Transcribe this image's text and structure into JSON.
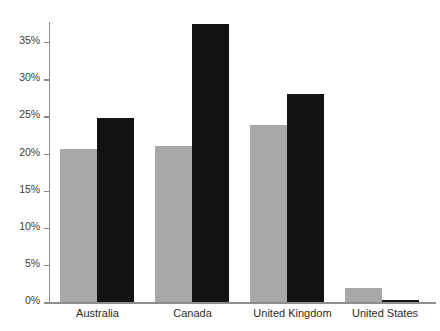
{
  "chart_data": {
    "type": "bar",
    "title": "",
    "subtitle": "",
    "xlabel": "",
    "ylabel": "",
    "categories": [
      "Australia",
      "Canada",
      "United Kingdom",
      "United States"
    ],
    "series": [
      {
        "name": "series-1",
        "color": "#a8a8a8",
        "values": [
          20.6,
          21.0,
          23.8,
          1.9
        ]
      },
      {
        "name": "series-2",
        "color": "#121212",
        "values": [
          24.8,
          37.5,
          28.0,
          0.3
        ]
      }
    ],
    "ylim": [
      0,
      37.5
    ],
    "y_ticks": [
      0,
      5,
      10,
      15,
      20,
      25,
      30,
      35
    ],
    "y_tick_labels": [
      "0%",
      "5%",
      "10%",
      "15%",
      "20%",
      "25%",
      "30%",
      "35%"
    ],
    "grid": false,
    "legend": "none",
    "axis_color": "#8e8e8e",
    "tick_label_color": "#3d3d3d",
    "category_label_color": "#2b2b2b",
    "background": "#ffffff"
  },
  "axis": {
    "y_labels": {
      "t0": "0%",
      "t5": "5%",
      "t10": "10%",
      "t15": "15%",
      "t20": "20%",
      "t25": "25%",
      "t30": "30%",
      "t35": "35%"
    },
    "x_labels": {
      "g0": "Australia",
      "g1": "Canada",
      "g2": "United Kingdom",
      "g3": "United States"
    }
  }
}
